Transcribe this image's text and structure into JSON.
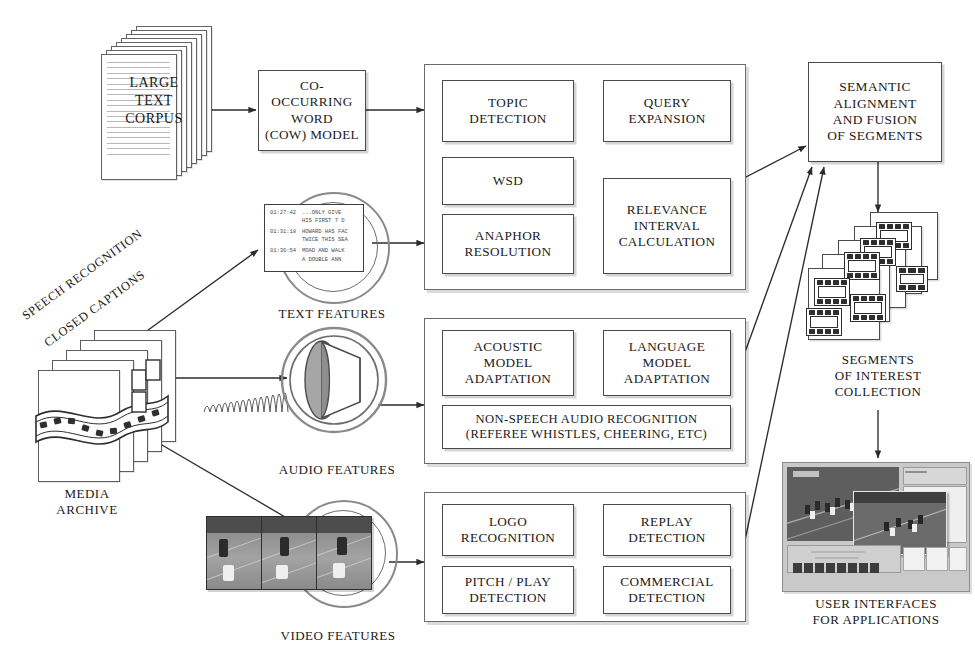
{
  "figure": {
    "bottom_caption": ""
  },
  "inputs": {
    "corpus": {
      "label_line1": "LARGE",
      "label_line2": "TEXT",
      "label_line3": "CORPUS",
      "icon": "document-stack-icon"
    },
    "media_archive": {
      "label_line1": "MEDIA",
      "label_line2": "ARCHIVE",
      "icon": "film-stack-icon"
    }
  },
  "edge_labels": {
    "speech_recognition": "SPEECH RECOGNITION",
    "closed_captions": "CLOSED CAPTIONS"
  },
  "cow_model": {
    "line1": "CO-OCCURRING",
    "line2": "WORD",
    "line3": "(COW) MODEL"
  },
  "feature_icons": {
    "text": {
      "caption": "TEXT FEATURES",
      "icon": "closed-caption-box-icon"
    },
    "audio": {
      "caption": "AUDIO FEATURES",
      "icon": "speaker-waveform-icon"
    },
    "video": {
      "caption": "VIDEO FEATURES",
      "icon": "video-filmstrip-icon"
    }
  },
  "closed_caption_sample": {
    "rows": [
      {
        "time": "01:27:42",
        "text": "...ONLY GIVE\nHIS FIRST 7 D"
      },
      {
        "time": "01:31:18",
        "text": "HOWARD HAS FAC\nTWICE THIS SEA"
      },
      {
        "time": "01:36:54",
        "text": "MOAD AND WALK\nA DOUBLE ANN"
      }
    ]
  },
  "panels": {
    "text": {
      "name": "text-analysis-panel",
      "boxes": [
        {
          "id": "topic-detection",
          "lines": [
            "TOPIC",
            "DETECTION"
          ]
        },
        {
          "id": "query-expansion",
          "lines": [
            "QUERY",
            "EXPANSION"
          ]
        },
        {
          "id": "wsd",
          "lines": [
            "WSD"
          ]
        },
        {
          "id": "anaphor-resolution",
          "lines": [
            "ANAPHOR",
            "RESOLUTION"
          ]
        },
        {
          "id": "relevance-interval-calculation",
          "lines": [
            "RELEVANCE",
            "INTERVAL",
            "CALCULATION"
          ]
        }
      ]
    },
    "audio": {
      "name": "audio-analysis-panel",
      "boxes": [
        {
          "id": "acoustic-model-adaptation",
          "lines": [
            "ACOUSTIC",
            "MODEL",
            "ADAPTATION"
          ]
        },
        {
          "id": "language-model-adaptation",
          "lines": [
            "LANGUAGE",
            "MODEL",
            "ADAPTATION"
          ]
        },
        {
          "id": "non-speech-audio-recognition",
          "lines": [
            "NON-SPEECH AUDIO RECOGNITION",
            "(REFEREE WHISTLES, CHEERING, ETC)"
          ]
        }
      ]
    },
    "video": {
      "name": "video-analysis-panel",
      "boxes": [
        {
          "id": "logo-recognition",
          "lines": [
            "LOGO",
            "RECOGNITION"
          ]
        },
        {
          "id": "replay-detection",
          "lines": [
            "REPLAY",
            "DETECTION"
          ]
        },
        {
          "id": "pitch-play-detection",
          "lines": [
            "PITCH / PLAY",
            "DETECTION"
          ]
        },
        {
          "id": "commercial-detection",
          "lines": [
            "COMMERCIAL",
            "DETECTION"
          ]
        }
      ]
    }
  },
  "fusion": {
    "lines": [
      "SEMANTIC",
      "ALIGNMENT",
      "AND FUSION",
      "OF SEGMENTS"
    ]
  },
  "outputs": {
    "segments": {
      "line1": "SEGMENTS",
      "line2": "OF INTEREST",
      "line3": "COLLECTION",
      "icon": "film-segments-stack-icon"
    },
    "user_interfaces": {
      "line1": "USER INTERFACES",
      "line2": "FOR APPLICATIONS",
      "icon": "application-screenshot-icon"
    }
  },
  "colors": {
    "background": "#ffffff",
    "box_border": "#4a4a4a",
    "panel_border": "#6b6b6b",
    "text": "#1a1a1a",
    "arrow": "#2b2b2b"
  }
}
